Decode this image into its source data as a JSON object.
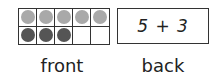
{
  "front": {
    "label": "front",
    "ten_frame": {
      "rows": 2,
      "cols": 5,
      "cells": [
        {
          "filled": true,
          "color": "#a9a9a9"
        },
        {
          "filled": true,
          "color": "#a9a9a9"
        },
        {
          "filled": true,
          "color": "#a9a9a9"
        },
        {
          "filled": true,
          "color": "#a9a9a9"
        },
        {
          "filled": true,
          "color": "#a9a9a9"
        },
        {
          "filled": true,
          "color": "#555555"
        },
        {
          "filled": true,
          "color": "#555555"
        },
        {
          "filled": true,
          "color": "#555555"
        },
        {
          "filled": false,
          "color": ""
        },
        {
          "filled": false,
          "color": ""
        }
      ]
    }
  },
  "back": {
    "label": "back",
    "expression": "5 + 3"
  }
}
